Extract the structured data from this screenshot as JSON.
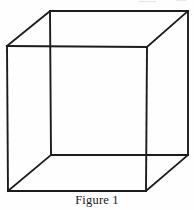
{
  "figure": {
    "caption": "Figure 1",
    "alt_name": "wireframe-cube",
    "background_color": "#fefefe",
    "line_color": "#1c1c1c",
    "line_width_px": 1.9,
    "canvas": {
      "width": 194,
      "height": 210
    },
    "vertices": {
      "front_top_left": [
        7,
        46
      ],
      "front_top_right": [
        147,
        47
      ],
      "front_bottom_right": [
        146,
        191
      ],
      "front_bottom_left": [
        8,
        191
      ],
      "back_top_left": [
        50,
        11
      ],
      "back_top_right": [
        188,
        11
      ],
      "back_bottom_right": [
        188,
        155
      ],
      "back_bottom_left": [
        51,
        155
      ]
    },
    "edges": [
      {
        "name": "front-top-edge",
        "points": "7,46 147,47"
      },
      {
        "name": "front-right-edge",
        "points": "147,47 146,191"
      },
      {
        "name": "front-bottom-edge",
        "points": "146,191 8,191"
      },
      {
        "name": "front-left-edge",
        "points": "8,191 7,46"
      },
      {
        "name": "back-top-edge",
        "points": "50,11 188,11"
      },
      {
        "name": "back-right-edge",
        "points": "188,11 188,155"
      },
      {
        "name": "back-bottom-edge",
        "points": "188,155 51,155"
      },
      {
        "name": "back-left-edge",
        "points": "51,155 50,11"
      },
      {
        "name": "connector-top-left",
        "points": "7,46 50,11"
      },
      {
        "name": "connector-top-right",
        "points": "147,47 188,11"
      },
      {
        "name": "connector-bottom-right",
        "points": "146,191 188,155"
      },
      {
        "name": "connector-bottom-left",
        "points": "8,191 51,155"
      }
    ]
  }
}
